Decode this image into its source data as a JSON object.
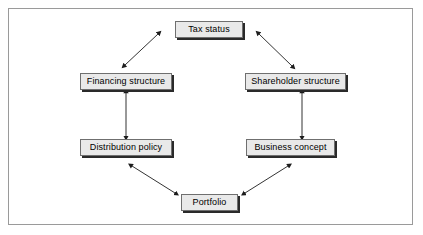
{
  "diagram": {
    "frame": {
      "border_color": "#9a9a9a",
      "background": "#ffffff"
    },
    "node_style": {
      "fill": "#e9e9e9",
      "border_color": "#6f6f6f",
      "shadow_color": "#2a2a2a",
      "text_color": "#000000"
    },
    "arrow_style": {
      "color": "#1c1c1c",
      "type": "double-headed"
    },
    "nodes": [
      {
        "id": "tax-status",
        "label": "Tax status",
        "x": 175,
        "y": 21,
        "w": 68,
        "h": 17
      },
      {
        "id": "financing-structure",
        "label": "Financing structure",
        "x": 80,
        "y": 73,
        "w": 92,
        "h": 17
      },
      {
        "id": "shareholder-structure",
        "label": "Shareholder structure",
        "x": 245,
        "y": 73,
        "w": 101,
        "h": 17
      },
      {
        "id": "distribution-policy",
        "label": "Distribution policy",
        "x": 80,
        "y": 139,
        "w": 92,
        "h": 17
      },
      {
        "id": "business-concept",
        "label": "Business concept",
        "x": 246,
        "y": 139,
        "w": 89,
        "h": 17
      },
      {
        "id": "portfolio",
        "label": "Portfolio",
        "x": 181,
        "y": 194,
        "w": 57,
        "h": 17
      }
    ],
    "connections": [
      {
        "id": "financing-structure--tax-status",
        "from": "financing-structure",
        "to": "tax-status",
        "x1": 125,
        "y1": 65,
        "x2": 158,
        "y2": 34
      },
      {
        "id": "tax-status--shareholder-structure",
        "from": "tax-status",
        "to": "shareholder-structure",
        "x1": 259,
        "y1": 34,
        "x2": 292,
        "y2": 66
      },
      {
        "id": "financing-structure--distribution-policy",
        "from": "financing-structure",
        "to": "distribution-policy",
        "x1": 126,
        "y1": 93,
        "x2": 126,
        "y2": 136
      },
      {
        "id": "shareholder-structure--business-concept",
        "from": "shareholder-structure",
        "to": "business-concept",
        "x1": 302,
        "y1": 93,
        "x2": 302,
        "y2": 136
      },
      {
        "id": "distribution-policy--portfolio",
        "from": "distribution-policy",
        "to": "portfolio",
        "x1": 132,
        "y1": 166,
        "x2": 175,
        "y2": 193
      },
      {
        "id": "business-concept--portfolio",
        "from": "business-concept",
        "to": "portfolio",
        "x1": 288,
        "y1": 166,
        "x2": 245,
        "y2": 193
      }
    ]
  }
}
